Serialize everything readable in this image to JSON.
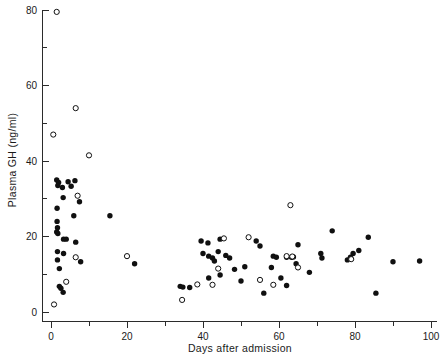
{
  "chart_data": {
    "type": "scatter",
    "title": "",
    "xlabel": "Days after admission",
    "ylabel": "Plasma GH (ng/ml)",
    "xlim": [
      0,
      100
    ],
    "ylim": [
      0,
      80
    ],
    "xticks": [
      0,
      20,
      40,
      60,
      80,
      100
    ],
    "xtick_labels": [
      "0",
      "20",
      "40",
      "60",
      "80",
      "100"
    ],
    "xminor_interval": 10,
    "yticks": [
      0,
      20,
      40,
      60,
      80
    ],
    "ytick_labels": [
      "0",
      "20",
      "40",
      "60",
      "80"
    ],
    "yminor_interval": 10,
    "grid": false,
    "legend": null,
    "series": [
      {
        "name": "filled",
        "marker": "filled-circle",
        "color": "#101010",
        "points": [
          [
            1.5,
            35.0
          ],
          [
            2.0,
            34.3
          ],
          [
            1.8,
            33.5
          ],
          [
            3.0,
            33.0
          ],
          [
            4.5,
            34.5
          ],
          [
            5.3,
            33.3
          ],
          [
            6.3,
            34.8
          ],
          [
            3.2,
            30.3
          ],
          [
            7.5,
            29.2
          ],
          [
            1.6,
            27.5
          ],
          [
            6.0,
            25.5
          ],
          [
            15.5,
            25.5
          ],
          [
            1.6,
            24.0
          ],
          [
            1.7,
            22.3
          ],
          [
            1.5,
            21.2
          ],
          [
            1.8,
            20.8
          ],
          [
            3.3,
            19.3
          ],
          [
            4.0,
            19.3
          ],
          [
            6.5,
            18.5
          ],
          [
            1.7,
            16.0
          ],
          [
            3.3,
            15.5
          ],
          [
            7.8,
            13.3
          ],
          [
            22.0,
            12.8
          ],
          [
            1.7,
            13.8
          ],
          [
            2.2,
            11.5
          ],
          [
            2.2,
            6.8
          ],
          [
            2.6,
            6.3
          ],
          [
            3.2,
            5.2
          ],
          [
            34.0,
            6.8
          ],
          [
            34.7,
            6.6
          ],
          [
            36.5,
            6.5
          ],
          [
            39.5,
            18.8
          ],
          [
            41.3,
            18.3
          ],
          [
            40.0,
            15.5
          ],
          [
            41.5,
            14.8
          ],
          [
            42.5,
            14.3
          ],
          [
            44.0,
            16.0
          ],
          [
            43.0,
            13.5
          ],
          [
            44.5,
            19.3
          ],
          [
            46.0,
            15.0
          ],
          [
            47.0,
            14.3
          ],
          [
            48.3,
            11.3
          ],
          [
            44.5,
            9.8
          ],
          [
            41.5,
            9.0
          ],
          [
            51.0,
            12.0
          ],
          [
            54.0,
            18.8
          ],
          [
            55.0,
            17.5
          ],
          [
            58.0,
            11.8
          ],
          [
            58.5,
            14.8
          ],
          [
            59.3,
            14.5
          ],
          [
            62.0,
            14.5
          ],
          [
            63.3,
            14.5
          ],
          [
            63.8,
            14.6
          ],
          [
            60.5,
            9.0
          ],
          [
            62.0,
            7.0
          ],
          [
            68.0,
            10.5
          ],
          [
            71.0,
            15.5
          ],
          [
            71.3,
            14.3
          ],
          [
            74.0,
            21.5
          ],
          [
            78.0,
            13.8
          ],
          [
            78.8,
            14.5
          ],
          [
            79.5,
            15.5
          ],
          [
            81.0,
            16.3
          ],
          [
            83.5,
            19.8
          ],
          [
            85.5,
            5.0
          ],
          [
            90.0,
            13.3
          ],
          [
            97.0,
            13.5
          ],
          [
            50.0,
            8.2
          ],
          [
            56.0,
            5.0
          ],
          [
            64.5,
            12.8
          ],
          [
            65.0,
            17.8
          ]
        ]
      },
      {
        "name": "open",
        "marker": "open-circle",
        "color": "#101010",
        "points": [
          [
            1.5,
            79.5
          ],
          [
            6.5,
            54.0
          ],
          [
            0.6,
            47.0
          ],
          [
            10.0,
            41.5
          ],
          [
            7.0,
            30.8
          ],
          [
            20.0,
            14.8
          ],
          [
            6.5,
            14.5
          ],
          [
            4.0,
            8.0
          ],
          [
            0.8,
            2.0
          ],
          [
            34.5,
            3.2
          ],
          [
            45.5,
            19.5
          ],
          [
            44.0,
            11.5
          ],
          [
            38.5,
            7.3
          ],
          [
            52.0,
            19.8
          ],
          [
            55.0,
            8.5
          ],
          [
            58.5,
            7.2
          ],
          [
            62.0,
            14.8
          ],
          [
            63.5,
            14.7
          ],
          [
            63.0,
            28.3
          ],
          [
            65.0,
            11.8
          ],
          [
            79.0,
            14.0
          ],
          [
            42.5,
            7.2
          ]
        ]
      }
    ]
  },
  "axis": {
    "x_title": "Days after admission",
    "y_title": "Plasma GH (ng/ml)",
    "x_labels": [
      "0",
      "20",
      "40",
      "60",
      "80",
      "100"
    ],
    "y_labels": [
      "0",
      "20",
      "40",
      "60",
      "80"
    ]
  },
  "colors": {
    "axis": "#2b2b2b",
    "marker": "#101010",
    "background": "#ffffff"
  }
}
